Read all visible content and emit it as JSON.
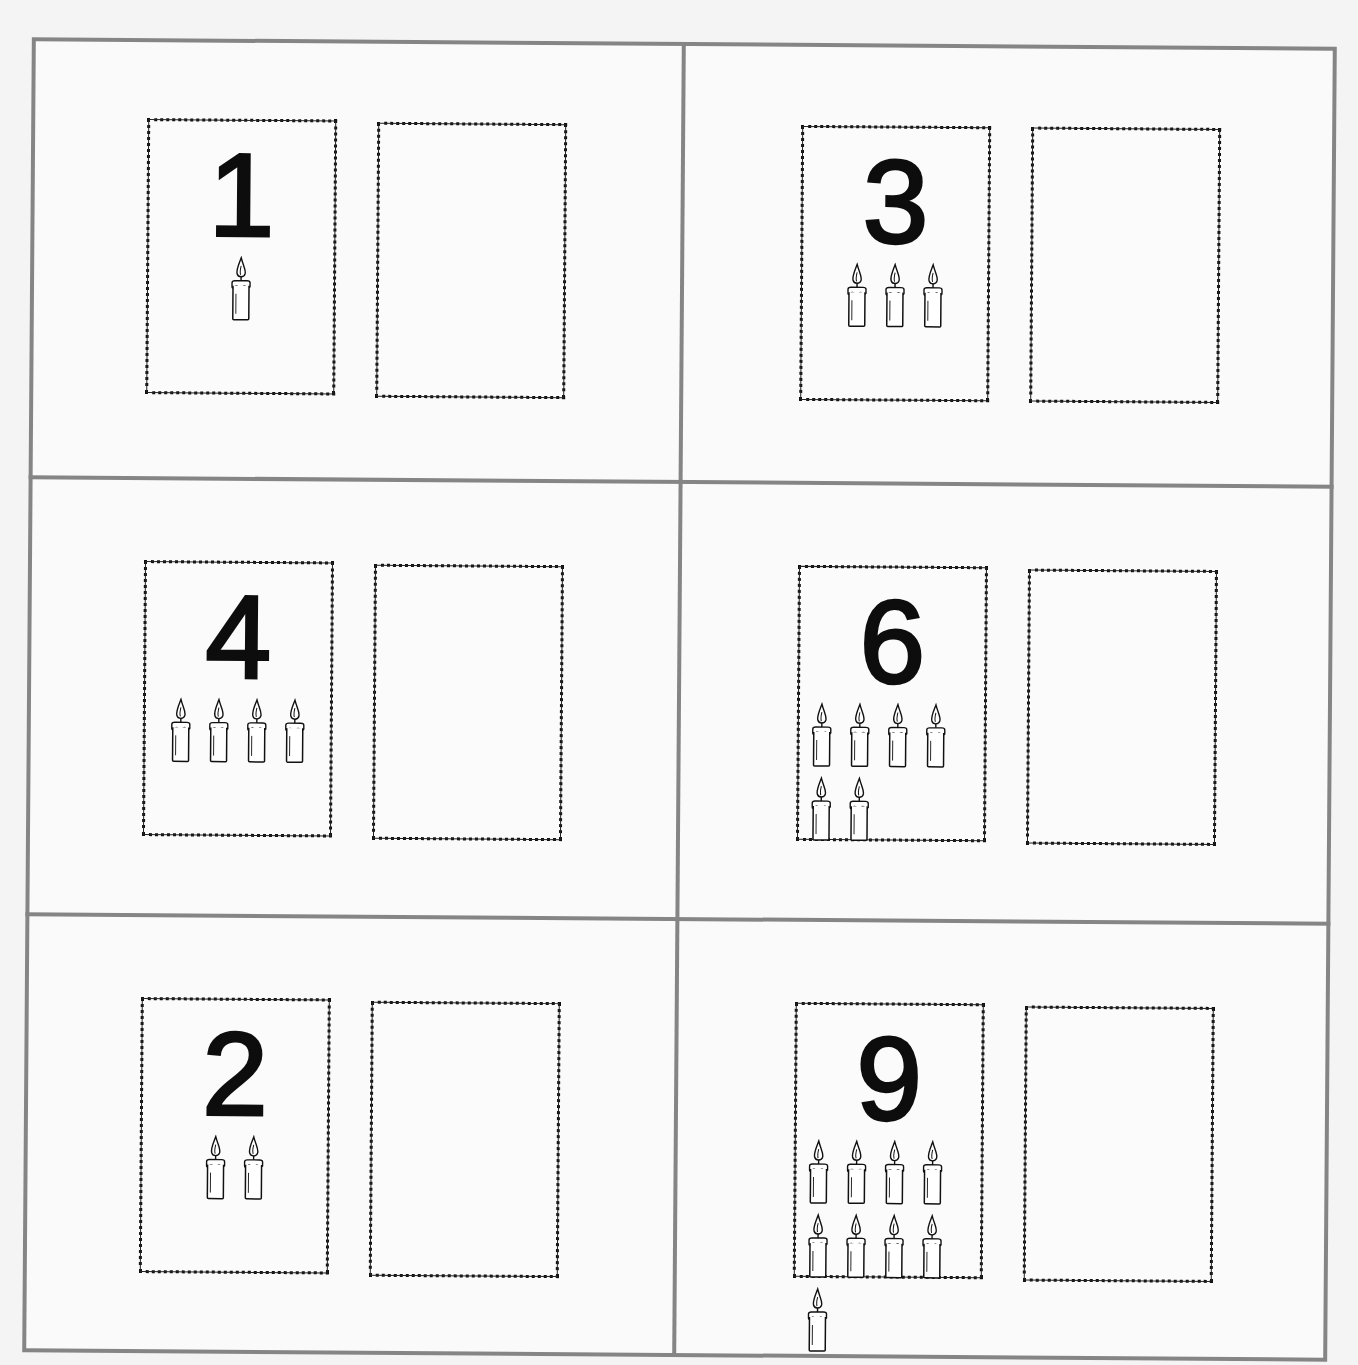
{
  "worksheet": {
    "layout": {
      "rows": 3,
      "columns": 2
    },
    "colors": {
      "grid_line": "#858585",
      "card_border": "#111111",
      "numeral": "#0d0d0d",
      "paper": "#f4f4f4"
    },
    "cells": [
      {
        "numeral": "1",
        "candle_count": 1,
        "icon": "candle-icon",
        "answer_card": ""
      },
      {
        "numeral": "3",
        "candle_count": 3,
        "icon": "candle-icon",
        "answer_card": ""
      },
      {
        "numeral": "4",
        "candle_count": 4,
        "icon": "candle-icon",
        "answer_card": ""
      },
      {
        "numeral": "6",
        "candle_count": 6,
        "icon": "candle-icon",
        "answer_card": ""
      },
      {
        "numeral": "2",
        "candle_count": 2,
        "icon": "candle-icon",
        "answer_card": ""
      },
      {
        "numeral": "9",
        "candle_count": 9,
        "icon": "candle-icon",
        "answer_card": ""
      }
    ]
  }
}
